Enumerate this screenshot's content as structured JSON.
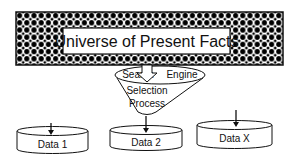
{
  "diagram": {
    "title_box": {
      "label": "Universe of Present Facts"
    },
    "funnel": {
      "top_left_label": "Search",
      "top_right_label": "Engine",
      "body_label_line1": "Selection",
      "body_label_line2": "Process"
    },
    "datastores": [
      {
        "label": "Data 1"
      },
      {
        "label": "Data 2"
      },
      {
        "label": "Data X"
      }
    ],
    "colors": {
      "stroke": "#111111",
      "fill": "#ffffff",
      "pattern": "#000000"
    }
  }
}
